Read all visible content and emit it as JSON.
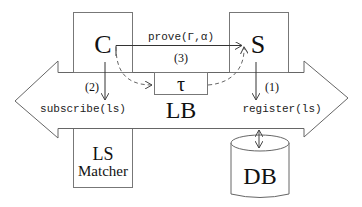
{
  "diagram": {
    "nodes": {
      "client": {
        "label": "C"
      },
      "server": {
        "label": "S"
      },
      "token": {
        "label": "τ"
      },
      "bus": {
        "label": "LB"
      },
      "matcher": {
        "label_line1": "LS",
        "label_line2": "Matcher"
      },
      "database": {
        "label": "DB"
      }
    },
    "edges": {
      "prove": {
        "label": "prove(Γ,α)",
        "step": "(3)"
      },
      "subscribe": {
        "label": "subscribe(ls)",
        "step": "(2)"
      },
      "register": {
        "label": "register(ls)",
        "step": "(1)"
      }
    }
  }
}
